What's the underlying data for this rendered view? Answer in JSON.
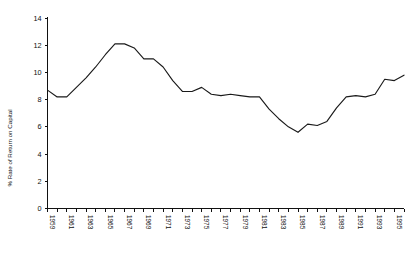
{
  "chart_data": {
    "type": "line",
    "title": "",
    "subtitle": "",
    "xlabel": "",
    "ylabel": "% Rate of Return on Capital",
    "xlim": [
      1959,
      1996
    ],
    "ylim": [
      0,
      14
    ],
    "grid": false,
    "legend": null,
    "annotations": [],
    "y_ticks": [
      0,
      2,
      4,
      6,
      8,
      10,
      12,
      14
    ],
    "y_tick_labels": [
      "0",
      "2",
      "4",
      "6",
      "8",
      "10",
      "12",
      "14"
    ],
    "x_tick_years": [
      1959,
      1960,
      1961,
      1962,
      1963,
      1964,
      1965,
      1966,
      1967,
      1968,
      1969,
      1970,
      1971,
      1972,
      1973,
      1974,
      1975,
      1976,
      1977,
      1978,
      1979,
      1980,
      1981,
      1982,
      1983,
      1984,
      1985,
      1986,
      1987,
      1988,
      1989,
      1990,
      1991,
      1992,
      1993,
      1994,
      1995,
      1996
    ],
    "x_tick_labels_shown": [
      "1959",
      "1961",
      "1963",
      "1965",
      "1967",
      "1969",
      "1971",
      "1973",
      "1975",
      "1977",
      "1979",
      "1981",
      "1983",
      "1985",
      "1987",
      "1989",
      "1991",
      "1993",
      "1995"
    ],
    "series": [
      {
        "name": "Rate of Return on Capital",
        "color": "#1a1a1a",
        "x": [
          1959,
          1960,
          1961,
          1962,
          1963,
          1964,
          1965,
          1966,
          1967,
          1968,
          1969,
          1970,
          1971,
          1972,
          1973,
          1974,
          1975,
          1976,
          1977,
          1978,
          1979,
          1980,
          1981,
          1982,
          1983,
          1984,
          1985,
          1986,
          1987,
          1988,
          1989,
          1990,
          1991,
          1992,
          1993,
          1994,
          1995,
          1996
        ],
        "values": [
          8.7,
          8.2,
          8.2,
          8.9,
          9.6,
          10.4,
          11.3,
          12.1,
          12.1,
          11.8,
          11.0,
          11.0,
          10.4,
          9.4,
          8.6,
          8.6,
          8.9,
          8.4,
          8.3,
          8.4,
          8.3,
          8.2,
          8.2,
          7.3,
          6.6,
          6.0,
          5.6,
          6.2,
          6.1,
          6.4,
          7.4,
          8.2,
          8.3,
          8.2,
          7.9,
          7.5,
          7.2,
          7.2
        ],
        "values_tail": [
          8.4,
          9.5,
          9.4,
          9.8
        ]
      }
    ]
  },
  "axis": {
    "y_axis_title": "% Rate of Return on Capital"
  }
}
